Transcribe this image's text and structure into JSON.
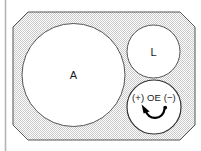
{
  "figure": {
    "background_color": "#ffffff",
    "plate": {
      "name": "chamfered-plate",
      "fill_pattern": "stipple-checker",
      "fill_color": "#e8e8e8",
      "stroke_color": "#555555"
    },
    "left_rule": {
      "color": "#b4b4b4"
    },
    "circles": [
      {
        "id": "aperture-a",
        "label": "A",
        "cx": 73.5,
        "cy": 75,
        "r": 51.5,
        "fill": "#ffffff",
        "stroke": "#555555"
      },
      {
        "id": "aperture-l",
        "label": "L",
        "cx": 153.5,
        "cy": 51.5,
        "r": 26.5,
        "fill": "#ffffff",
        "stroke": "#555555"
      },
      {
        "id": "aperture-oe",
        "label": "OE",
        "cx": 154,
        "cy": 107,
        "r": 27,
        "fill": "#ffffff",
        "stroke": "#333333"
      }
    ],
    "oe_markings": {
      "positive": "(+)",
      "center": "OE",
      "negative": "(−)",
      "full_text": "(+) OE (−)",
      "arrow_name": "rotation-arrow",
      "arrow_color": "#000000"
    }
  }
}
